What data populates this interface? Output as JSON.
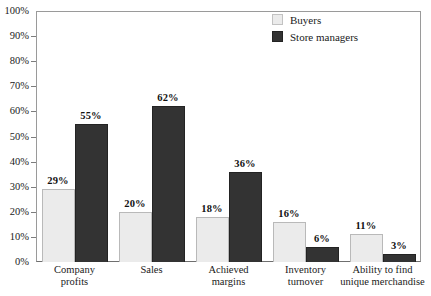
{
  "chart_data": {
    "type": "bar",
    "title": "",
    "subtitle": "",
    "xlabel": "",
    "ylabel": "",
    "ylim": [
      0,
      100
    ],
    "ytick_labels": [
      "100%",
      "90%",
      "80%",
      "70%",
      "60%",
      "50%",
      "40%",
      "30%",
      "20%",
      "10%",
      "0%"
    ],
    "ytick_values": [
      100,
      90,
      80,
      70,
      60,
      50,
      40,
      30,
      20,
      10,
      0
    ],
    "grid": false,
    "legend_position": "top-right",
    "categories": [
      "Company profits",
      "Sales",
      "Achieved margins",
      "Inventory turnover",
      "Ability to find unique merchandise"
    ],
    "category_lines": [
      [
        "Company",
        "profits"
      ],
      [
        "Sales"
      ],
      [
        "Achieved",
        "margins"
      ],
      [
        "Inventory",
        "turnover"
      ],
      [
        "Ability to find",
        "unique merchandise"
      ]
    ],
    "series": [
      {
        "name": "Buyers",
        "color": "#ebebeb",
        "values": [
          29,
          20,
          18,
          16,
          11
        ],
        "value_labels": [
          "29%",
          "20%",
          "18%",
          "16%",
          "11%"
        ]
      },
      {
        "name": "Store managers",
        "color": "#333333",
        "values": [
          55,
          62,
          36,
          6,
          3
        ],
        "value_labels": [
          "55%",
          "62%",
          "36%",
          "6%",
          "3%"
        ]
      }
    ]
  },
  "legend": {
    "items": [
      {
        "label": "Buyers",
        "color": "#ebebeb"
      },
      {
        "label": "Store managers",
        "color": "#333333"
      }
    ]
  }
}
